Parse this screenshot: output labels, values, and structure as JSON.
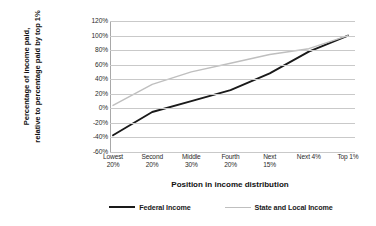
{
  "chart_data": {
    "type": "line",
    "title": "",
    "xlabel": "Position in income distribution",
    "ylabel_lines": [
      "Percentage of income paid,",
      "relative to percentage paid by top 1%"
    ],
    "ylabel": "Percentage of income paid, relative to percentage paid by top 1%",
    "categories": [
      "Lowest 20%",
      "Second 20%",
      "Middle 30%",
      "Fourth 20%",
      "Next 15%",
      "Next 4%",
      "Top 1%"
    ],
    "category_lines": [
      [
        "Lowest",
        "20%"
      ],
      [
        "Second",
        "20%"
      ],
      [
        "Middle",
        "30%"
      ],
      [
        "Fourth",
        "20%"
      ],
      [
        "Next",
        "15%"
      ],
      [
        "Next 4%",
        ""
      ],
      [
        "Top 1%",
        ""
      ]
    ],
    "series": [
      {
        "name": "Federal Income",
        "color": "#1a1a1a",
        "width": 1.9,
        "values": [
          -37,
          -5,
          10,
          25,
          48,
          78,
          100
        ]
      },
      {
        "name": "State and Local Income",
        "color": "#bfbfbf",
        "width": 1.4,
        "values": [
          4,
          33,
          50,
          62,
          74,
          82,
          100
        ]
      }
    ],
    "ylim": [
      -60,
      120
    ],
    "yticks": [
      120,
      100,
      80,
      60,
      40,
      20,
      0,
      -20,
      -40,
      -60
    ],
    "ytick_labels": [
      "120%",
      "100%",
      "80%",
      "60%",
      "40%",
      "20%",
      "0%",
      "-20%",
      "-40%",
      "-60%"
    ],
    "grid": true,
    "grid_color": "#c9c9c9",
    "legend_position": "bottom",
    "background": "#ffffff"
  }
}
